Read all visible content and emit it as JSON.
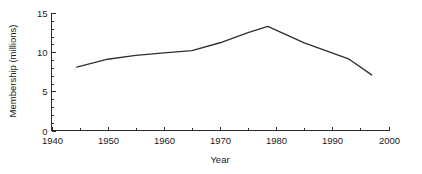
{
  "chart_data": {
    "type": "line",
    "title": "",
    "subtitle": "",
    "xlabel": "Year",
    "ylabel": "Membership (millions)",
    "xlim": [
      1940,
      2000
    ],
    "ylim": [
      0,
      15
    ],
    "grid": false,
    "legend": false,
    "legend_position": "none",
    "x_major_ticks": [
      1940,
      1950,
      1960,
      1970,
      1980,
      1990,
      2000
    ],
    "x_major_tick_labels": [
      "1940",
      "1950",
      "1960",
      "1970",
      "1980",
      "1990",
      "2000"
    ],
    "x_minor_ticks": [
      1945,
      1955,
      1965,
      1975,
      1985,
      1995
    ],
    "y_major_ticks": [
      0,
      5,
      10,
      15
    ],
    "y_major_tick_labels": [
      "0",
      "5",
      "10",
      "15"
    ],
    "y_minor_ticks": [
      1,
      2,
      3,
      4,
      6,
      7,
      8,
      9,
      11,
      12,
      13,
      14
    ],
    "series": [
      {
        "name": "Membership",
        "color": "#303030",
        "x": [
          1944.5,
          1950,
          1955,
          1960,
          1965,
          1970,
          1975,
          1978.5,
          1985,
          1993,
          1997
        ],
        "values": [
          8.1,
          9.1,
          9.6,
          9.9,
          10.2,
          11.2,
          12.5,
          13.3,
          11.2,
          9.1,
          7.1
        ]
      }
    ]
  },
  "axis": {
    "y_title": "Membership (millions)",
    "x_title": "Year"
  },
  "colors": {
    "line": "#303030",
    "axis": "#2b2b2b",
    "background": "#ffffff",
    "text": "#1a1a1a"
  }
}
